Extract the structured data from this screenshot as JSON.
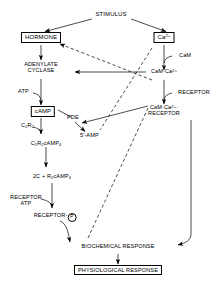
{
  "diagram": {
    "type": "flow-diagram",
    "colors": {
      "stroke": "#000000",
      "background": "#ffffff",
      "text": "#000000"
    },
    "nodes": {
      "stimulus": {
        "label": "STIMULUS",
        "boxed": false
      },
      "hormone": {
        "label": "HORMONE",
        "boxed": true
      },
      "calcium": {
        "label": "Ca",
        "sup": "2+",
        "boxed": true
      },
      "cam": {
        "label": "CaM",
        "boxed": false
      },
      "adenylate_cyclase": {
        "line1": "ADENYLATE",
        "line2": "CYCLASE",
        "boxed": false
      },
      "cam_ca": {
        "label": "CaM·Ca",
        "sup": "2+",
        "boxed": false
      },
      "receptor_right": {
        "label": "RECEPTOR",
        "boxed": false
      },
      "cam_ca_receptor": {
        "line1": "CaM·Ca",
        "line1_sup": "2+",
        "line1_tail": "·",
        "line2": "RECEPTOR",
        "boxed": false
      },
      "atp": {
        "label": "ATP",
        "boxed": false
      },
      "camp": {
        "label": "cAMP",
        "boxed": true
      },
      "pde": {
        "label": "PDE",
        "boxed": false
      },
      "amp5": {
        "label": "5'-AMP",
        "boxed": false
      },
      "c2r2": {
        "label": "C",
        "sub1": "2",
        "mid": "R",
        "sub2": "2",
        "boxed": false
      },
      "c2r2_camp4": {
        "label": "C",
        "sub1": "2",
        "mid": "R",
        "sub2": "2",
        "tail": "cAMP",
        "sub3": "4",
        "boxed": false
      },
      "free_c_r2camp4": {
        "pre": "2C + R",
        "sub1": "2",
        "tail": "cAMP",
        "sub2": "4",
        "boxed": false
      },
      "receptor_atp": {
        "line1": "RECEPTOR",
        "line2": "ATP",
        "boxed": false
      },
      "receptor_p": {
        "label": "RECEPTOR-",
        "marker": "P",
        "boxed": false
      },
      "biochemical_response": {
        "label": "BIOCHEMICAL RESPONSE",
        "boxed": false
      },
      "physiological_response": {
        "label": "PHYSIOLOGICAL RESPONSE",
        "boxed": true
      }
    },
    "edge_styles": {
      "solid": "solid",
      "dashed": "dashed"
    }
  }
}
